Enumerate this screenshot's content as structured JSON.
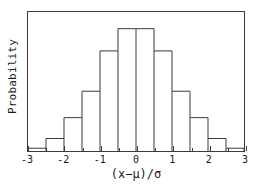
{
  "chart_data": {
    "type": "bar",
    "title": "",
    "subtitle": "",
    "xlabel": "(x−μ)/σ",
    "ylabel": "Probability",
    "grid": false,
    "legend": null,
    "xlim": [
      -3,
      3
    ],
    "ylim": [
      0,
      1
    ],
    "bin_width": 0.5,
    "xticks": [
      -3,
      -2,
      -1,
      0,
      1,
      2,
      3
    ],
    "xticklabels": [
      "-3",
      "-2",
      "-1",
      "0",
      "1",
      "2",
      "3"
    ],
    "yticks": [],
    "yticklabels": [],
    "bin_edges": [
      -3,
      -2.5,
      -2,
      -1.5,
      -1,
      -0.5,
      0,
      0.5,
      1,
      1.5,
      2,
      2.5,
      3
    ],
    "bin_centers": [
      -2.75,
      -2.25,
      -1.75,
      -1.25,
      -0.75,
      -0.25,
      0.25,
      0.75,
      1.25,
      1.75,
      2.25,
      2.75
    ],
    "categories": [
      "-3 to -2.5",
      "-2.5 to -2",
      "-2 to -1.5",
      "-1.5 to -1",
      "-1 to -0.5",
      "-0.5 to 0",
      "0 to 0.5",
      "0.5 to 1",
      "1 to 1.5",
      "1.5 to 2",
      "2 to 2.5",
      "2.5 to 3"
    ],
    "values": [
      0.02,
      0.09,
      0.24,
      0.43,
      0.72,
      0.88,
      0.88,
      0.72,
      0.43,
      0.24,
      0.09,
      0.02
    ],
    "annotations": []
  },
  "axes": {
    "xlabel": "(x−μ)/σ",
    "ylabel": "Probability",
    "xticklabels": [
      "-3",
      "-2",
      "-1",
      "0",
      "1",
      "2",
      "3"
    ]
  },
  "style": {
    "bar_edge_color": "#3a3a3a",
    "bar_fill_color": "#ffffff",
    "frame_color": "#3a3a3a",
    "text_color": "#1a1a1a",
    "background_color": "#ffffff"
  }
}
